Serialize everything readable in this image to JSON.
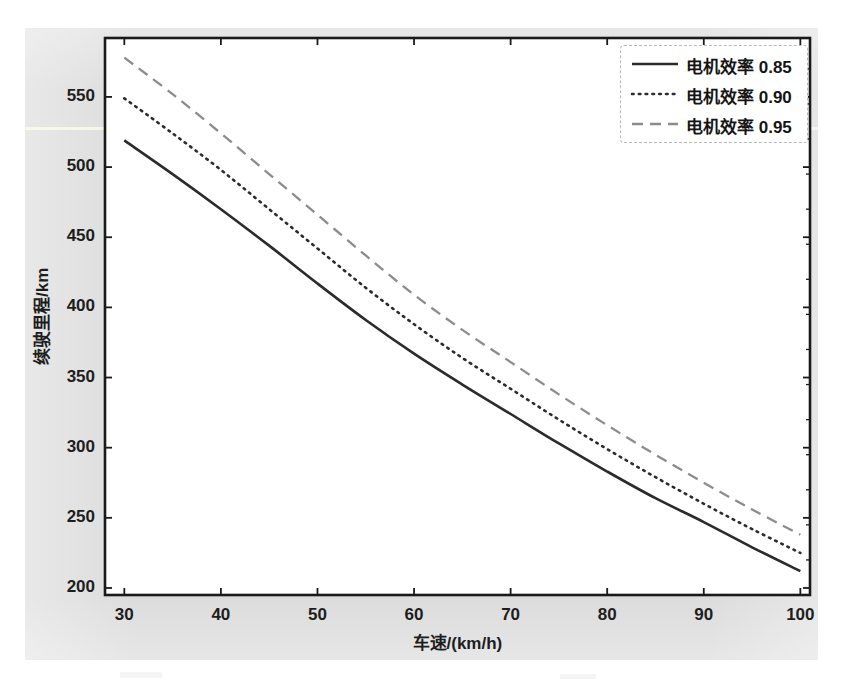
{
  "page": {
    "top_text_remnant": "",
    "figure_bg": "#dcdcdc",
    "plot_bg": "#ffffff",
    "axis_color": "#1a1a1a"
  },
  "chart_data": {
    "type": "line",
    "title": "",
    "xlabel": "车速/(km/h)",
    "ylabel": "续驶里程/km",
    "xlim": [
      28,
      101
    ],
    "ylim": [
      195,
      592
    ],
    "xticks": [
      30,
      40,
      50,
      60,
      70,
      80,
      90,
      100
    ],
    "xtick_labels": [
      "30",
      "40",
      "50",
      "60",
      "70",
      "80",
      "90",
      "100"
    ],
    "yticks": [
      200,
      250,
      300,
      350,
      400,
      450,
      500,
      550
    ],
    "ytick_labels": [
      "200",
      "250",
      "300",
      "350",
      "400",
      "450",
      "500",
      "550"
    ],
    "grid": false,
    "legend_position": "upper right",
    "x": [
      30,
      35,
      40,
      45,
      50,
      55,
      60,
      65,
      70,
      75,
      80,
      85,
      90,
      95,
      100
    ],
    "series": [
      {
        "name": "电机效率 0.85",
        "label": "电机效率 0.85",
        "style": "solid",
        "color": "#2b2b2b",
        "values": [
          519,
          495,
          470,
          444,
          417,
          391,
          367,
          345,
          324,
          303,
          283,
          264,
          247,
          229,
          212
        ]
      },
      {
        "name": "电机效率 0.90",
        "label": "电机效率 0.90",
        "style": "dotted",
        "color": "#2b2b2b",
        "values": [
          549,
          524,
          498,
          470,
          442,
          414,
          388,
          364,
          342,
          320,
          299,
          279,
          260,
          242,
          225
        ]
      },
      {
        "name": "电机效率 0.95",
        "label": "电机效率 0.95",
        "style": "dashed",
        "color": "#8c8c8c",
        "values": [
          578,
          552,
          524,
          495,
          466,
          437,
          409,
          384,
          361,
          338,
          316,
          295,
          275,
          256,
          238
        ]
      }
    ]
  }
}
